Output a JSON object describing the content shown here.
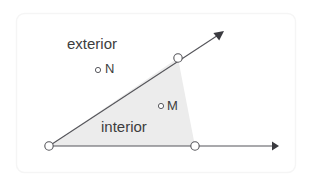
{
  "figure": {
    "card": {
      "background_color": "#ffffff",
      "border_color": "#f4f4f4",
      "border_radius": 8
    },
    "region": {
      "name": "interior-shaded-region",
      "fill_color": "#ececec"
    },
    "stroke_color": "#55555a",
    "labels": {
      "exterior": "exterior",
      "interior": "interior",
      "point_n": "N",
      "point_m": "M"
    },
    "points": [
      {
        "name": "vertex",
        "x": 49,
        "y": 146,
        "marker": "open-circle",
        "radius": 4.2
      },
      {
        "name": "ray-up-point",
        "x": 178,
        "y": 58,
        "marker": "open-circle",
        "radius": 4.2
      },
      {
        "name": "ray-right-point",
        "x": 195,
        "y": 146,
        "marker": "open-circle",
        "radius": 4.2
      },
      {
        "name": "point-n",
        "x": 98,
        "y": 70,
        "marker": "small-open-circle",
        "radius": 2.6
      },
      {
        "name": "point-m",
        "x": 161,
        "y": 106,
        "marker": "small-open-circle",
        "radius": 2.6
      }
    ],
    "rays": [
      {
        "name": "ray-upper",
        "x1": 49,
        "y1": 146,
        "x2": 224,
        "y2": 31,
        "arrow": "end"
      },
      {
        "name": "ray-horizontal",
        "x1": 49,
        "y1": 146,
        "x2": 279,
        "y2": 146,
        "arrow": "end"
      }
    ]
  }
}
